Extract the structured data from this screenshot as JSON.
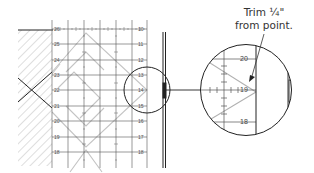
{
  "annotation": {
    "line1": "Trim ¼\"",
    "line2": "from point."
  },
  "ruler": {
    "row_numbers": [
      "26",
      "25",
      "24",
      "23",
      "22",
      "21",
      "20",
      "19",
      "18"
    ],
    "right_numbers": [
      "10",
      "11",
      "12",
      "13",
      "14",
      "15",
      "16",
      "17",
      "18"
    ]
  },
  "magnified": {
    "numbers": [
      "20",
      "19",
      "18"
    ]
  },
  "colors": {
    "line": "#222222",
    "grid": "#555555",
    "diagonal": "#bdbdbd",
    "hatch": "#d9d9d9"
  }
}
